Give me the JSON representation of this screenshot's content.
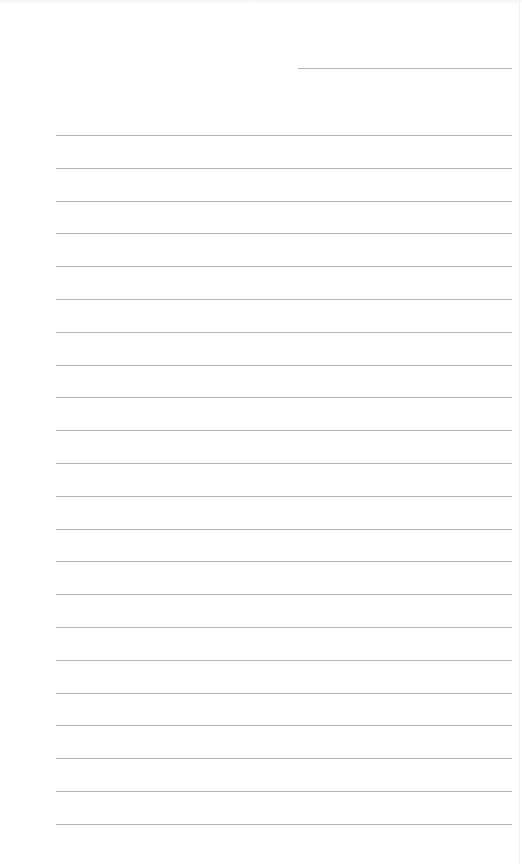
{
  "page": {
    "type": "lined-notepad",
    "background": "#ffffff",
    "line_color": "#b3b3b3",
    "date_line": {
      "x": 298,
      "y": 68,
      "width": 214
    },
    "rules": {
      "start_y": 135,
      "spacing": 32.8,
      "count": 22,
      "x": 56,
      "width": 456
    }
  }
}
